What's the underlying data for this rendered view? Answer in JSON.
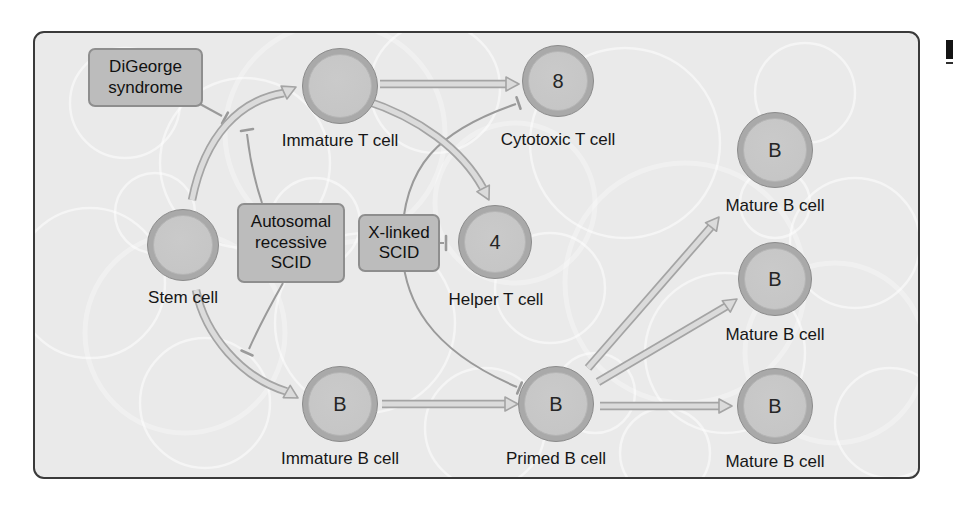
{
  "figure": {
    "type": "immune-cell-development-diagram",
    "colors": {
      "page_bg": "#ffffff",
      "panel_bg": "#eaeaea",
      "panel_border": "#3a3a3a",
      "box_fill": "#bcbcbc",
      "box_border": "#8e8e8e",
      "cell_ring": "#a9a9a9",
      "cell_fill": "#c6c6c6",
      "arrow_fill": "#dbdbdb",
      "arrow_outline": "#a4a4a4",
      "inhibit": "#9a9a9a",
      "text": "#161616"
    },
    "boxes": [
      {
        "id": "digeorge",
        "label": "DiGeorge syndrome",
        "lines": [
          "DiGeorge",
          "syndrome"
        ]
      },
      {
        "id": "autosomal-recessive-scid",
        "label": "Autosomal recessive SCID",
        "lines": [
          "Autosomal",
          "recessive",
          "SCID"
        ]
      },
      {
        "id": "x-linked-scid",
        "label": "X-linked SCID",
        "lines": [
          "X-linked",
          "SCID"
        ]
      }
    ],
    "cells": [
      {
        "id": "stem",
        "label": "Stem cell",
        "letter": ""
      },
      {
        "id": "immature-t",
        "label": "Immature T cell",
        "letter": ""
      },
      {
        "id": "cytotoxic-t",
        "label": "Cytotoxic T cell",
        "letter": "8"
      },
      {
        "id": "helper-t",
        "label": "Helper T cell",
        "letter": "4"
      },
      {
        "id": "immature-b",
        "label": "Immature B cell",
        "letter": "B"
      },
      {
        "id": "primed-b",
        "label": "Primed B cell",
        "letter": "B"
      },
      {
        "id": "mature-b-top",
        "label": "Mature B cell",
        "letter": "B"
      },
      {
        "id": "mature-b-middle",
        "label": "Mature B cell",
        "letter": "B"
      },
      {
        "id": "mature-b-bottom",
        "label": "Mature B cell",
        "letter": "B"
      }
    ],
    "relations": {
      "differentiation_arrows": [
        [
          "Stem cell",
          "Immature T cell"
        ],
        [
          "Stem cell",
          "Immature B cell"
        ],
        [
          "Immature T cell",
          "Cytotoxic T cell"
        ],
        [
          "Immature T cell",
          "Helper T cell"
        ],
        [
          "Immature B cell",
          "Primed B cell"
        ],
        [
          "Primed B cell",
          "Mature B cell (top)"
        ],
        [
          "Primed B cell",
          "Mature B cell (middle)"
        ],
        [
          "Primed B cell",
          "Mature B cell (bottom)"
        ]
      ],
      "inhibition_links": [
        [
          "DiGeorge syndrome",
          "Stem cell to Immature T cell arrow"
        ],
        [
          "Autosomal recessive SCID",
          "Stem cell to Immature T cell arrow"
        ],
        [
          "Autosomal recessive SCID",
          "Stem cell to Immature B cell arrow"
        ],
        [
          "X-linked SCID",
          "Helper T cell"
        ],
        [
          "X-linked SCID",
          "Cytotoxic T cell"
        ],
        [
          "X-linked SCID",
          "Primed B cell"
        ]
      ]
    }
  }
}
